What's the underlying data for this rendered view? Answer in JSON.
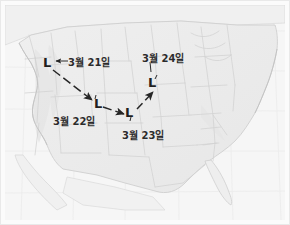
{
  "figure": {
    "kind": "weather-map-track-diagram",
    "region": "United States",
    "background_color": "#f4f4f4",
    "ink_color": "#2b2b2b",
    "coastline_color": "#c9c9c9",
    "state_border_color": "#d4d4d4",
    "graticule_color": "#ececec"
  },
  "track": {
    "description_markers": [
      "L",
      "L",
      "L",
      "L"
    ],
    "points": [
      {
        "id": "p1",
        "marker": "L",
        "label": "3월 21일",
        "x": 47,
        "y": 64,
        "label_x": 70,
        "label_y": 58
      },
      {
        "id": "p2",
        "marker": "L",
        "label": "3월 22일",
        "x": 98,
        "y": 104,
        "label_x": 54,
        "label_y": 119
      },
      {
        "id": "p3",
        "marker": "L",
        "label": "3월 23일",
        "x": 128,
        "y": 113,
        "label_x": 124,
        "label_y": 133
      },
      {
        "id": "p4",
        "marker": "L",
        "label": "3월 24일",
        "x": 152,
        "y": 84,
        "label_x": 144,
        "label_y": 55
      }
    ]
  },
  "labels": {
    "mar21": "3월 21일",
    "mar22": "3월 22일",
    "mar23": "3월 23일",
    "mar24": "3월 24일"
  },
  "markers": {
    "low1": "L",
    "low2": "L",
    "low3": "L",
    "low4": "L"
  }
}
